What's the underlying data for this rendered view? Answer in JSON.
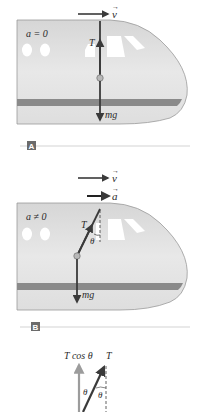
{
  "figure": {
    "panels": [
      {
        "id": "A",
        "tag": "A",
        "velocity_label": "v",
        "acceleration_condition": "a = 0",
        "tension_label": "T",
        "weight_label": "mg"
      },
      {
        "id": "B",
        "tag": "B",
        "velocity_label": "v",
        "acceleration_label": "a",
        "acceleration_condition": "a ≠ 0",
        "tension_label": "T",
        "angle_label": "θ",
        "weight_label": "mg"
      }
    ],
    "components": {
      "vertical_component_label": "T cos θ",
      "tension_label": "T",
      "angle_label_left": "θ",
      "angle_label_right": "θ"
    },
    "colors": {
      "fuselage": "#dcdcdc",
      "fuselage_light": "#ececec",
      "stripe": "#8a8a8a",
      "outline": "#9a9a9a",
      "vector": "#3a3a3a",
      "component_vector": "#9c9c9c",
      "tag_bg": "#6b6b6b",
      "divider": "#c8c8c8"
    }
  }
}
